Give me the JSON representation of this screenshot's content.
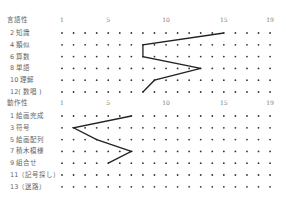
{
  "chart_data": {
    "type": "line",
    "title": "",
    "x_ticks": [
      1,
      5,
      10,
      15,
      19
    ],
    "xlim": [
      1,
      19
    ],
    "grid": "dots",
    "sections": [
      {
        "name": "言語性",
        "rows": [
          "2 知識",
          "4 類似",
          "6 算数",
          "8 単語",
          "10 理解",
          "12( 数唱 )"
        ],
        "values": [
          15,
          8,
          8,
          13,
          9,
          8
        ]
      },
      {
        "name": "動作性",
        "rows": [
          "1 絵画完成",
          "3 符号",
          "5 絵画配列",
          "7 積木模様",
          "9 組合せ",
          "11（記号探し）",
          "13（迷路）"
        ],
        "values": [
          7,
          2,
          4,
          7,
          5,
          null,
          null
        ]
      }
    ]
  },
  "header": {
    "verbal_label": "言語性",
    "performance_label": "動作性",
    "ticks": [
      "1",
      "5",
      "10",
      "15",
      "19"
    ]
  }
}
